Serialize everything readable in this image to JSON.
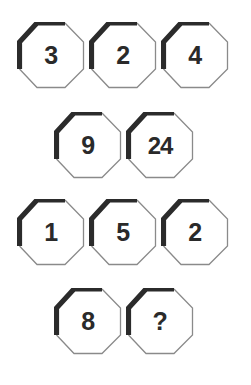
{
  "figure": {
    "type": "sequence-puzzle",
    "background_color": "#ffffff",
    "shape": "octagon",
    "shape_thick_edge_color": "#2b2b2b",
    "shape_thin_edge_color": "#8a8a8a",
    "shape_fill_color": "#ffffff",
    "label_color": "#2a2a2a",
    "rows": [
      {
        "row_name": "row-1",
        "y": 22,
        "cells": [
          {
            "label": "3",
            "x": 17
          },
          {
            "label": "2",
            "x": 89
          },
          {
            "label": "4",
            "x": 161
          }
        ]
      },
      {
        "row_name": "row-2",
        "y": 112,
        "cells": [
          {
            "label": "9",
            "x": 54
          },
          {
            "label": "24",
            "x": 126
          }
        ]
      },
      {
        "row_name": "row-3",
        "y": 199,
        "cells": [
          {
            "label": "1",
            "x": 17
          },
          {
            "label": "5",
            "x": 89
          },
          {
            "label": "2",
            "x": 161
          }
        ]
      },
      {
        "row_name": "row-4",
        "y": 288,
        "cells": [
          {
            "label": "8",
            "x": 54
          },
          {
            "label": "?",
            "x": 126
          }
        ]
      }
    ]
  }
}
